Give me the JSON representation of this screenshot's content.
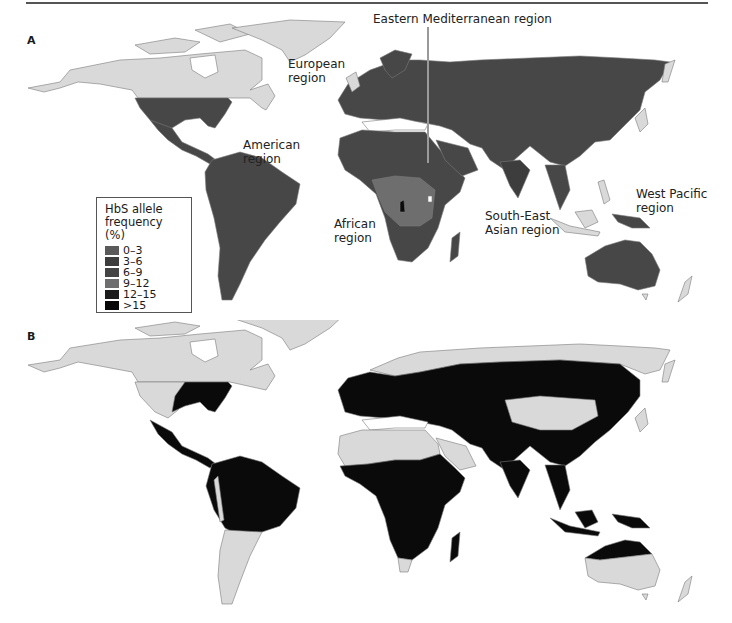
{
  "figure": {
    "panels": [
      {
        "label": "A",
        "legend": {
          "title_line1": "HbS allele",
          "title_line2": "frequency (%)",
          "items": [
            {
              "label": "0–3",
              "color": "#5a5a5a"
            },
            {
              "label": "3–6",
              "color": "#3d3d3d"
            },
            {
              "label": "6–9",
              "color": "#444444"
            },
            {
              "label": "9–12",
              "color": "#6e6e6e"
            },
            {
              "label": "12–15",
              "color": "#1c1c1c"
            },
            {
              "label": ">15",
              "color": "#080808"
            }
          ]
        },
        "region_labels": [
          {
            "text_line1": "Eastern Mediterranean region",
            "text_line2": ""
          },
          {
            "text_line1": "European",
            "text_line2": "region"
          },
          {
            "text_line1": "American",
            "text_line2": "region"
          },
          {
            "text_line1": "African",
            "text_line2": "region"
          },
          {
            "text_line1": "South-East",
            "text_line2": "Asian region"
          },
          {
            "text_line1": "West Pacific",
            "text_line2": "region"
          }
        ]
      },
      {
        "label": "B"
      }
    ],
    "colors": {
      "no_data_land": "#d9d9d9",
      "low_freq_land": "#474747",
      "malaria_land": "#0a0a0a",
      "outline": "#7a7a7a"
    }
  }
}
